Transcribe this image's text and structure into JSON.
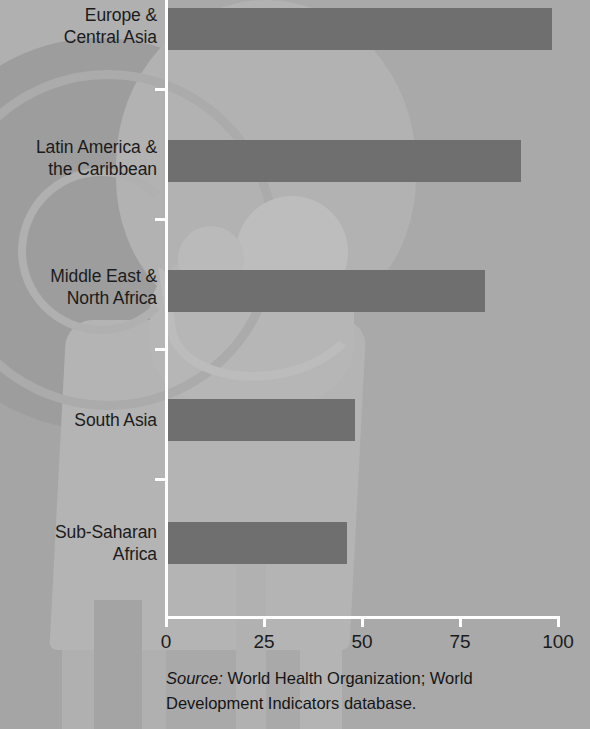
{
  "chart_data": {
    "type": "bar",
    "orientation": "horizontal",
    "title": "",
    "subtitle": "",
    "xlabel": "",
    "ylabel": "",
    "categories": [
      "Europe &\nCentral Asia",
      "Latin America &\nthe Caribbean",
      "Middle East &\nNorth Africa",
      "South Asia",
      "Sub-Saharan\nAfrica"
    ],
    "values": [
      98,
      90,
      81,
      48,
      46
    ],
    "xlim": [
      0,
      100
    ],
    "xticks": [
      0,
      25,
      50,
      75,
      100
    ],
    "xtick_labels": [
      "0",
      "25",
      "50",
      "75",
      "100"
    ],
    "grid": false,
    "legend": null,
    "bar_color": "#6f6f6f",
    "axis_color": "#ffffff",
    "plot_background": "#a9a9a9"
  },
  "categories": [
    {
      "line1": "Europe &",
      "line2": "Central Asia"
    },
    {
      "line1": "Latin America &",
      "line2": "the Caribbean"
    },
    {
      "line1": "Middle East &",
      "line2": "North Africa"
    },
    {
      "line1": "South Asia",
      "line2": ""
    },
    {
      "line1": "Sub-Saharan",
      "line2": "Africa"
    }
  ],
  "xticks": [
    {
      "label": "0"
    },
    {
      "label": "25"
    },
    {
      "label": "50"
    },
    {
      "label": "75"
    },
    {
      "label": "100"
    }
  ],
  "source": {
    "prefix": "Source:",
    "line1_rest": " World Health Organization; World",
    "line2": "Development Indicators database."
  }
}
